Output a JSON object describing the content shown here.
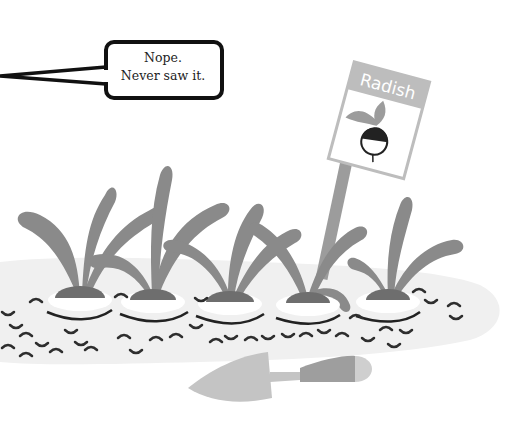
{
  "speech_bubble": {
    "line1": "Nope.",
    "line2": "Never saw it."
  },
  "sign": {
    "label": "Radish",
    "icon": "radish-icon"
  },
  "scene": {
    "plants": [
      "radish-plant-1",
      "radish-plant-2",
      "radish-plant-3",
      "radish-plant-4",
      "radish-plant-5"
    ],
    "tool": "trowel-icon"
  },
  "colors": {
    "leaf": "#8a8a8a",
    "soil": "#f0f0f0",
    "mound": "#6e6e6e",
    "outline": "#222222",
    "sign_header": "#bdbdbd",
    "trowel_blade": "#c4c4c4",
    "trowel_handle": "#9e9e9e"
  }
}
